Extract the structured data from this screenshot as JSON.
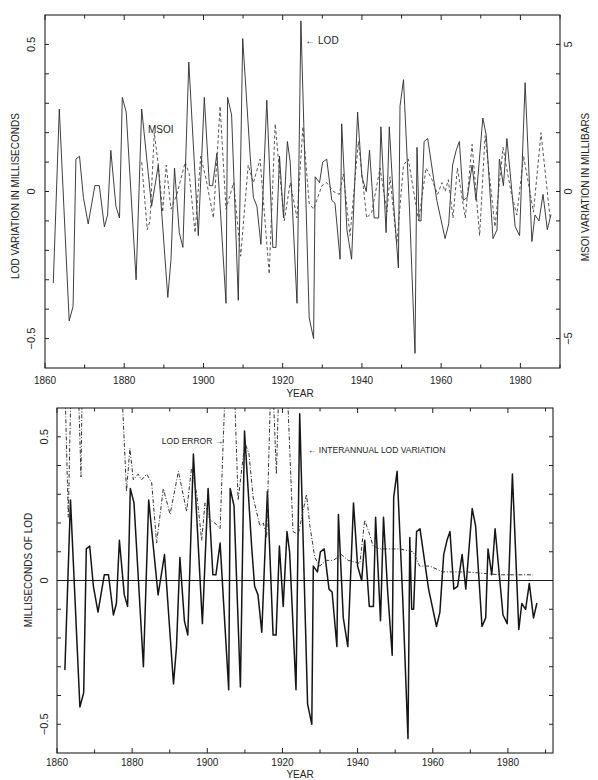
{
  "chart_data": [
    {
      "type": "line",
      "title": "",
      "xlabel": "YEAR",
      "ylabel": "LOD VARIATION IN MILLISECONDS",
      "y2label": "MSOI VARIATION IN MILLIBARS",
      "xlim": [
        1860,
        1990
      ],
      "ylim": [
        -0.6,
        0.6
      ],
      "y2lim": [
        -6,
        6
      ],
      "xticks": [
        1860,
        1880,
        1900,
        1920,
        1940,
        1960,
        1980
      ],
      "xtick_labels": [
        "1860",
        "1880",
        "1900",
        "1920",
        "1940",
        "1960",
        "1980"
      ],
      "xminor_step": 10,
      "yticks": [
        0.5,
        0,
        -0.5
      ],
      "ytick_labels": [
        "0.5",
        "0",
        "−0.5"
      ],
      "yminor_step": 0.1,
      "y2ticks": [
        5,
        0,
        -5
      ],
      "y2tick_labels": [
        "5",
        "0",
        "−5"
      ],
      "y2minor_step": 1,
      "grid": false,
      "legend": "none (inline labels)",
      "series": [
        {
          "name": "LOD",
          "axis": "left",
          "style": "solid",
          "x": [
            1862.1,
            1863.6,
            1866.1,
            1867.1,
            1867.8,
            1868.7,
            1869.7,
            1870.9,
            1872.6,
            1873.7,
            1875.0,
            1875.8,
            1876.6,
            1877.9,
            1878.8,
            1879.5,
            1880.5,
            1883.0,
            1884.4,
            1886.9,
            1888.6,
            1891.0,
            1891.8,
            1892.7,
            1893.9,
            1894.8,
            1896.3,
            1898.7,
            1900.2,
            1901.5,
            1902.3,
            1903.4,
            1905.7,
            1906.1,
            1907.1,
            1908.8,
            1909.9,
            1911.8,
            1912.6,
            1913.5,
            1914.5,
            1916.0,
            1917.5,
            1918.3,
            1919.2,
            1920.2,
            1921.2,
            1921.9,
            1923.6,
            1924.6,
            1926.7,
            1927.8,
            1928.2,
            1929.3,
            1930.1,
            1931.1,
            1932.4,
            1933.2,
            1934.5,
            1934.9,
            1936.2,
            1937.4,
            1938.9,
            1940.0,
            1941.1,
            1941.9,
            1943.1,
            1944.2,
            1944.8,
            1946.1,
            1946.9,
            1948.0,
            1949.2,
            1949.6,
            1950.5,
            1952.0,
            1953.4,
            1953.9,
            1954.4,
            1954.9,
            1955.7,
            1956.6,
            1958.9,
            1961.0,
            1961.9,
            1962.9,
            1963.8,
            1964.6,
            1965.6,
            1966.6,
            1967.8,
            1968.8,
            1970.5,
            1971.4,
            1973.1,
            1974.1,
            1974.7,
            1975.7,
            1976.6,
            1978.7,
            1979.8,
            1981.2,
            1982.9,
            1983.7,
            1984.7,
            1985.7,
            1986.8,
            1987.7
          ],
          "values": [
            -0.31,
            0.28,
            -0.44,
            -0.39,
            0.11,
            0.12,
            -0.02,
            -0.11,
            0.02,
            0.02,
            -0.12,
            -0.08,
            0.14,
            -0.05,
            -0.09,
            0.32,
            0.27,
            -0.3,
            0.28,
            -0.05,
            0.09,
            -0.36,
            -0.23,
            0.08,
            -0.14,
            -0.19,
            0.44,
            -0.15,
            0.32,
            0.02,
            0.02,
            0.13,
            -0.38,
            0.32,
            0.26,
            -0.37,
            0.52,
            0.12,
            -0.02,
            -0.05,
            -0.18,
            0.31,
            -0.19,
            -0.19,
            0.12,
            -0.09,
            0.17,
            0.1,
            -0.38,
            0.58,
            -0.43,
            -0.5,
            0.05,
            0.03,
            0.1,
            0.11,
            -0.03,
            -0.04,
            -0.23,
            0.23,
            -0.13,
            -0.23,
            0.27,
            0.05,
            0.0,
            0.14,
            -0.09,
            -0.09,
            0.22,
            -0.14,
            0.22,
            -0.04,
            -0.26,
            0.29,
            0.38,
            -0.06,
            -0.55,
            0.15,
            -0.1,
            -0.1,
            0.17,
            0.18,
            -0.03,
            -0.16,
            -0.11,
            0.09,
            0.14,
            0.17,
            -0.03,
            -0.02,
            0.09,
            -0.03,
            0.25,
            0.19,
            -0.16,
            -0.13,
            0.11,
            0.02,
            0.18,
            -0.12,
            -0.15,
            0.37,
            -0.17,
            -0.08,
            -0.1,
            -0.01,
            -0.13,
            -0.08
          ]
        },
        {
          "name": "MSOI",
          "axis": "right",
          "style": "dashed",
          "x": [
            1884.4,
            1885.8,
            1886.5,
            1887.6,
            1888.6,
            1889.7,
            1890.6,
            1891.8,
            1893.3,
            1895.4,
            1896.4,
            1897.9,
            1899.3,
            1900.7,
            1902.5,
            1904.2,
            1905.7,
            1907.6,
            1909.4,
            1911.3,
            1912.6,
            1914.3,
            1916.6,
            1918.1,
            1919.2,
            1920.4,
            1921.9,
            1923.6,
            1925.1,
            1926.7,
            1927.8,
            1929.9,
            1931.1,
            1932.8,
            1934.3,
            1935.3,
            1937.0,
            1939.1,
            1941.2,
            1942.5,
            1944.6,
            1946.3,
            1947.1,
            1948.8,
            1950.5,
            1951.7,
            1954.3,
            1956.2,
            1957.7,
            1959.1,
            1960.2,
            1961.0,
            1961.8,
            1963.0,
            1964.1,
            1966.1,
            1967.8,
            1969.7,
            1971.1,
            1973.6,
            1975.6,
            1977.6,
            1979.1,
            1980.8,
            1983.3,
            1985.2,
            1987.5
          ],
          "values": [
            1.0,
            -1.3,
            -1.0,
            2.0,
            0.9,
            -0.7,
            0.9,
            -0.6,
            -0.1,
            1.0,
            0.6,
            -1.4,
            1.2,
            0.4,
            -0.9,
            2.9,
            -0.6,
            0.3,
            -2.2,
            0.9,
            0.3,
            1.1,
            -2.8,
            2.3,
            0.7,
            -1.0,
            0.3,
            -0.9,
            2.2,
            -0.4,
            -0.6,
            0.2,
            0.3,
            0.0,
            -0.1,
            0.6,
            -1.5,
            1.7,
            -0.9,
            -0.7,
            0.8,
            -0.7,
            0.5,
            -1.8,
            0.9,
            1.1,
            -1.0,
            0.8,
            0.4,
            -0.1,
            0.3,
            0.0,
            0.4,
            -0.9,
            0.8,
            -0.9,
            1.6,
            -1.5,
            1.9,
            -1.2,
            1.5,
            0.0,
            -0.8,
            1.2,
            -0.7,
            2.0,
            -0.9
          ]
        }
      ],
      "annotations": [
        {
          "text": "← LOD",
          "x": 1925.7,
          "y": 0.5,
          "axis": "left"
        },
        {
          "text": "MSOI",
          "x": 1886.0,
          "y": 0.2,
          "axis": "left"
        }
      ]
    },
    {
      "type": "line",
      "title": "",
      "xlabel": "YEAR",
      "ylabel": "MILLISECONDS OF LOD",
      "xlim": [
        1860,
        1992
      ],
      "ylim": [
        -0.6,
        0.6
      ],
      "xticks": [
        1860,
        1880,
        1900,
        1920,
        1940,
        1960,
        1980
      ],
      "xtick_labels": [
        "1860",
        "1880",
        "1900",
        "1920",
        "1940",
        "1960",
        "1980"
      ],
      "xminor_step": 10,
      "yticks": [
        0.5,
        0,
        -0.5
      ],
      "ytick_labels": [
        "0.5",
        "0",
        "−0.5"
      ],
      "yminor_step": 0.1,
      "right_axis_ticks": true,
      "zero_line": true,
      "grid": false,
      "legend": "none (inline labels)",
      "series": [
        {
          "name": "Interannual LOD variation",
          "axis": "left",
          "style": "solid",
          "x": [
            1862.1,
            1863.6,
            1866.1,
            1867.1,
            1867.8,
            1868.7,
            1869.7,
            1870.9,
            1872.6,
            1873.7,
            1875.0,
            1875.8,
            1876.6,
            1877.9,
            1878.8,
            1879.5,
            1880.5,
            1883.0,
            1884.4,
            1886.9,
            1888.6,
            1891.0,
            1891.8,
            1892.7,
            1893.9,
            1894.8,
            1896.3,
            1898.7,
            1900.2,
            1901.5,
            1902.3,
            1903.4,
            1905.7,
            1906.1,
            1907.1,
            1908.8,
            1909.9,
            1911.8,
            1912.6,
            1913.5,
            1914.5,
            1916.0,
            1917.5,
            1918.3,
            1919.2,
            1920.2,
            1921.2,
            1921.9,
            1923.6,
            1924.6,
            1926.7,
            1927.8,
            1928.2,
            1929.3,
            1930.1,
            1931.1,
            1932.4,
            1933.2,
            1934.5,
            1934.9,
            1936.2,
            1937.4,
            1938.9,
            1940.0,
            1941.1,
            1941.9,
            1943.1,
            1944.2,
            1944.8,
            1946.1,
            1946.9,
            1948.0,
            1949.2,
            1949.6,
            1950.5,
            1952.0,
            1953.4,
            1953.9,
            1954.4,
            1954.9,
            1955.7,
            1956.6,
            1958.9,
            1961.0,
            1961.9,
            1962.9,
            1963.8,
            1964.6,
            1965.6,
            1966.6,
            1967.8,
            1968.8,
            1970.5,
            1971.4,
            1973.1,
            1974.1,
            1974.7,
            1975.7,
            1976.6,
            1978.7,
            1979.8,
            1981.2,
            1982.9,
            1983.7,
            1984.7,
            1985.7,
            1986.8,
            1987.7
          ],
          "values": [
            -0.31,
            0.28,
            -0.44,
            -0.39,
            0.11,
            0.12,
            -0.02,
            -0.11,
            0.02,
            0.02,
            -0.12,
            -0.08,
            0.14,
            -0.05,
            -0.09,
            0.32,
            0.27,
            -0.3,
            0.28,
            -0.05,
            0.09,
            -0.36,
            -0.23,
            0.08,
            -0.14,
            -0.19,
            0.44,
            -0.15,
            0.32,
            0.02,
            0.02,
            0.13,
            -0.38,
            0.32,
            0.26,
            -0.37,
            0.52,
            0.12,
            -0.02,
            -0.05,
            -0.18,
            0.31,
            -0.19,
            -0.19,
            0.12,
            -0.09,
            0.17,
            0.1,
            -0.38,
            0.58,
            -0.43,
            -0.5,
            0.05,
            0.03,
            0.1,
            0.11,
            -0.03,
            -0.04,
            -0.23,
            0.23,
            -0.13,
            -0.23,
            0.27,
            0.05,
            0.0,
            0.14,
            -0.09,
            -0.09,
            0.22,
            -0.14,
            0.22,
            -0.04,
            -0.26,
            0.29,
            0.38,
            -0.06,
            -0.55,
            0.15,
            -0.1,
            -0.1,
            0.17,
            0.18,
            -0.03,
            -0.16,
            -0.11,
            0.09,
            0.14,
            0.17,
            -0.03,
            -0.02,
            0.09,
            -0.03,
            0.25,
            0.19,
            -0.16,
            -0.13,
            0.11,
            0.02,
            0.18,
            -0.12,
            -0.15,
            0.37,
            -0.17,
            -0.08,
            -0.1,
            -0.01,
            -0.13,
            -0.08
          ]
        },
        {
          "name": "LOD error",
          "axis": "left",
          "style": "dash-dot",
          "x": [
            1861.9,
            1863.0,
            1863.9,
            1865.4,
            1866.4,
            1866.8,
            1876.8,
            1878.5,
            1879.4,
            1880.3,
            1881.6,
            1882.5,
            1883.9,
            1885.2,
            1886.5,
            1888.3,
            1890.1,
            1892.3,
            1894.5,
            1895.8,
            1897.2,
            1898.5,
            1899.4,
            1900.7,
            1902.0,
            1903.4,
            1905.1,
            1906.9,
            1908.2,
            1910.0,
            1911.1,
            1912.2,
            1914.0,
            1914.9,
            1915.8,
            1917.1,
            1918.4,
            1919.3,
            1920.9,
            1922.8,
            1924.2,
            1926.4,
            1927.3,
            1928.6,
            1929.9,
            1931.7,
            1933.5,
            1935.7,
            1937.5,
            1940.6,
            1941.9,
            1943.2,
            1944.1,
            1945.9,
            1951.2,
            1954.8,
            1956.5,
            1959.2,
            1962.7,
            1969.0,
            1977.8,
            1986.7
          ],
          "values": [
            0.8,
            0.22,
            0.8,
            0.8,
            0.36,
            0.8,
            0.8,
            0.31,
            0.46,
            0.35,
            0.37,
            0.35,
            0.37,
            0.34,
            0.13,
            0.32,
            0.23,
            0.38,
            0.24,
            0.39,
            0.3,
            0.14,
            0.27,
            0.21,
            0.2,
            0.18,
            0.8,
            0.8,
            0.28,
            0.48,
            0.44,
            0.29,
            0.19,
            0.2,
            0.15,
            0.8,
            0.37,
            0.8,
            0.8,
            0.17,
            0.16,
            0.3,
            0.19,
            0.08,
            0.05,
            0.07,
            0.07,
            0.09,
            0.07,
            0.06,
            0.21,
            0.16,
            0.12,
            0.11,
            0.11,
            0.1,
            0.05,
            0.05,
            0.03,
            0.03,
            0.02,
            0.02
          ]
        }
      ],
      "annotations": [
        {
          "text": "LOD ERROR →",
          "x": 1887.9,
          "y": 0.475,
          "axis": "left"
        },
        {
          "text": "← INTERANNUAL LOD VARIATION",
          "x": 1926.8,
          "y": 0.443,
          "axis": "left"
        }
      ]
    }
  ]
}
